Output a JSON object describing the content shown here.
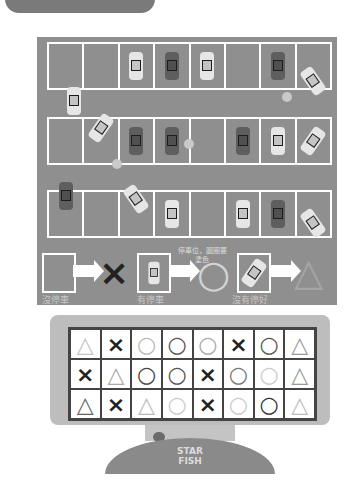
{
  "header": {
    "tab_text": ""
  },
  "parking_lot": {
    "rows": [
      {
        "spaces": [
          "empty",
          "empty",
          "light",
          "dark",
          "light",
          "empty",
          "dark",
          "tilted-light"
        ]
      },
      {
        "spaces": [
          "empty",
          "tilted-light",
          "dark",
          "dark",
          "empty",
          "dark",
          "light",
          "tilted-light"
        ]
      },
      {
        "spaces": [
          "dark",
          "empty",
          "tilted-light",
          "light",
          "empty",
          "light",
          "dark",
          "tilted-light"
        ]
      }
    ]
  },
  "legend": {
    "items": [
      {
        "label": "沒停車",
        "result": "×"
      },
      {
        "label": "有停車",
        "result": "○",
        "note": "停車位，圓圈要塗色"
      },
      {
        "label": "沒有停好",
        "result": "△"
      }
    ]
  },
  "answer_grid": {
    "rows": [
      [
        "△",
        "×",
        "○",
        "○",
        "○",
        "×",
        "○",
        "△"
      ],
      [
        "×",
        "△",
        "○",
        "○",
        "×",
        "○",
        "○",
        "△"
      ],
      [
        "△",
        "×",
        "△",
        "○",
        "×",
        "○",
        "○",
        "△"
      ]
    ]
  },
  "logo": {
    "line1": "STAR",
    "line2": "FISH"
  },
  "colors": {
    "lot": "#8f8f8f",
    "lines": "#ffffff",
    "monitor": "#bdbdbd",
    "base": "#8a8a8a"
  }
}
